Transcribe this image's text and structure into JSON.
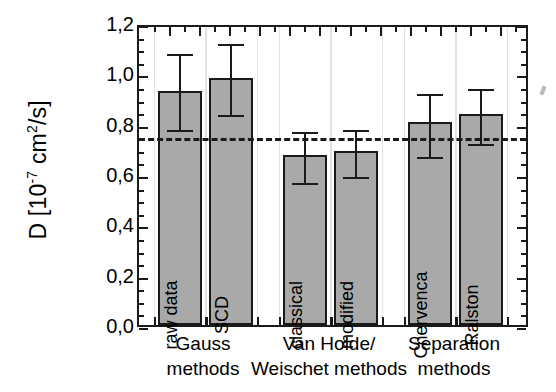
{
  "chart_data": {
    "type": "bar",
    "title": "",
    "xlabel": "",
    "ylabel": "D [10-7 cm2/s]",
    "ylabel_parts": {
      "prefix": "D [10",
      "exponent": "-7",
      "suffix": " cm",
      "exponent2": "2",
      "tail": "/s]"
    },
    "ylim": [
      0.0,
      1.2
    ],
    "ytick_labels": [
      "0,0",
      "0,2",
      "0,4",
      "0,6",
      "0,8",
      "1,0",
      "1,2"
    ],
    "ytick_values": [
      0.0,
      0.2,
      0.4,
      0.6,
      0.8,
      1.0,
      1.2
    ],
    "minor_tick_step": 0.05,
    "grid": "faint vertical gridlines only",
    "legend": "none",
    "categories": [
      "raw data",
      "SCD",
      "classical",
      "modified",
      "Chervenca",
      "Ralston"
    ],
    "values": [
      0.93,
      0.98,
      0.675,
      0.69,
      0.805,
      0.84
    ],
    "error_upper": [
      1.09,
      1.13,
      0.78,
      0.785,
      0.93,
      0.95
    ],
    "error_lower": [
      0.785,
      0.845,
      0.575,
      0.6,
      0.68,
      0.73
    ],
    "reference_line": {
      "value": 0.76,
      "style": "dashed"
    },
    "groups": [
      {
        "label": "Gauss\nmethods",
        "bars": [
          0,
          1
        ]
      },
      {
        "label": "Van Holde/\nWeischet methods",
        "bars": [
          2,
          3
        ]
      },
      {
        "label": "Separation\nmethods",
        "bars": [
          4,
          5
        ]
      }
    ],
    "colors": {
      "bar_fill": "#a9a9a9",
      "bar_edge": "#1a1a1a",
      "axis": "#1a1a1a",
      "gridline": "#e2e2e2"
    }
  },
  "axis": {
    "y_title_prefix": "D [10",
    "y_title_exp": "-7",
    "y_title_mid": " cm",
    "y_title_exp2": "2",
    "y_title_tail": "/s]"
  }
}
